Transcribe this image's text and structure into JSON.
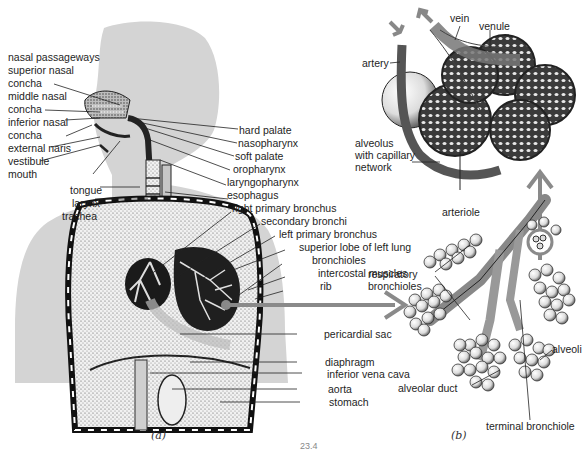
{
  "figure": {
    "page_number": "23.4",
    "panels": [
      {
        "caption": "(a)",
        "subject": "human respiratory system",
        "labels_left": [
          "nasal passageways",
          "superior nasal",
          "concha",
          "middle nasal",
          "concha",
          "inferior nasal",
          "concha",
          "external naris",
          "vestibule",
          "mouth",
          "tongue",
          "larynx",
          "trachea"
        ],
        "labels_right": [
          "hard palate",
          "nasopharynx",
          "soft palate",
          "oropharynx",
          "laryngopharynx",
          "esophagus",
          "right primary bronchus",
          "secondary bronchi",
          "left primary bronchus",
          "superior lobe of left lung",
          "bronchioles",
          "intercostal muscles",
          "rib",
          "pericardial sac",
          "diaphragm",
          "inferior vena cava",
          "aorta",
          "stomach"
        ]
      },
      {
        "caption": "(b)",
        "subject": "alveoli and capillary network",
        "labels": {
          "vein": "vein",
          "venule": "venule",
          "artery": "artery",
          "alveolus": [
            "alveolus",
            "with capillary",
            "network"
          ],
          "arteriole": "arteriole",
          "respiratory_bronchioles": [
            "respiratory",
            "bronchioles"
          ],
          "alveoli": "alveoli",
          "alveolar_duct": "alveolar duct",
          "terminal_bronchiole": "terminal bronchiole"
        }
      }
    ],
    "colors": {
      "silhouette": "#d4d4d4",
      "arrow": "#8a8a8a",
      "ink": "#1e1e1e",
      "tissue": "#ececec"
    }
  }
}
